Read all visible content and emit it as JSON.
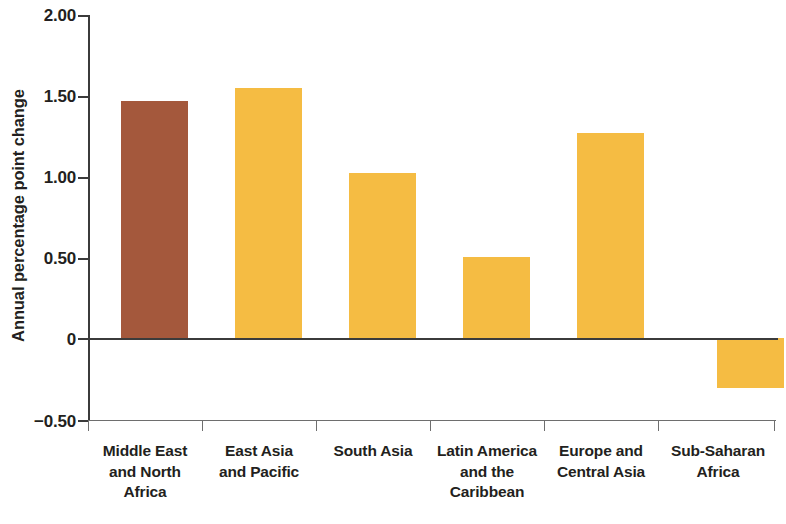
{
  "chart_data": {
    "type": "bar",
    "title": "",
    "subtitle": "",
    "xlabel": "",
    "ylabel": "Annual percentage point change",
    "ylim": [
      -0.5,
      2.0
    ],
    "yticks": [
      2.0,
      1.5,
      1.0,
      0.5,
      0,
      -0.5
    ],
    "ytick_labels": [
      "2.00",
      "1.50",
      "1.00",
      "0.50",
      "0",
      "−0.50"
    ],
    "grid": false,
    "legend": null,
    "categories": [
      "Middle East and North Africa",
      "East Asia and Pacific",
      "South Asia",
      "Latin America and the Caribbean",
      "Europe and Central Asia",
      "Sub-Saharan Africa"
    ],
    "category_lines": [
      [
        "Middle East",
        "and North Africa"
      ],
      [
        "East Asia",
        "and Pacific"
      ],
      [
        "South Asia"
      ],
      [
        "Latin America",
        "and the",
        "Caribbean"
      ],
      [
        "Europe and",
        "Central Asia"
      ],
      [
        "Sub-Saharan",
        "Africa"
      ]
    ],
    "values": [
      1.47,
      1.55,
      1.02,
      0.5,
      1.27,
      -0.31
    ],
    "bar_colors": [
      "#a4583c",
      "#f5bc43",
      "#f5bc43",
      "#f5bc43",
      "#f5bc43",
      "#f5bc43"
    ],
    "colors": {
      "highlight_bar": "#a4583c",
      "default_bar": "#f5bc43",
      "axis": "#3b3b3b",
      "rule": "#6e6e6e",
      "text": "#231f20",
      "background": "#ffffff"
    }
  }
}
